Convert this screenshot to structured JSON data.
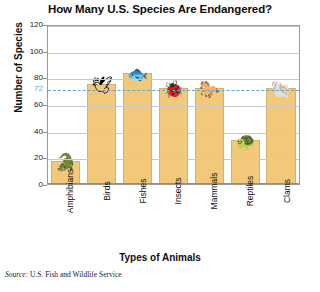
{
  "chart_data": {
    "type": "bar",
    "title": "How Many U.S. Species Are Endangered?",
    "xlabel": "Types of Animals",
    "ylabel": "Number of Species",
    "categories": [
      "Amphibians",
      "Birds",
      "Fishes",
      "Insects",
      "Mammals",
      "Reptiles",
      "Clams"
    ],
    "values": [
      17,
      75,
      83,
      72,
      72,
      33,
      72
    ],
    "ylim": [
      0,
      120
    ],
    "yticks": [
      0,
      20,
      40,
      60,
      80,
      100,
      120
    ],
    "grid": true,
    "legend": "none",
    "reference_line": {
      "value": 72,
      "label": "72",
      "style": "dashed",
      "color": "#63a6c6"
    },
    "bar_color": "#f2c97a",
    "icons": [
      "frog-icon",
      "bird-icon",
      "fish-icon",
      "beetle-icon",
      "horse-icon",
      "turtle-icon",
      "clam-icon"
    ],
    "source": "Source: U.S. Fish and Wildlife Service"
  },
  "source_note": {
    "prefix": "Source:",
    "text": "U.S. Fish and Wildlife Service",
    "full": "Source: U.S. Fish and Wildlife Service"
  }
}
